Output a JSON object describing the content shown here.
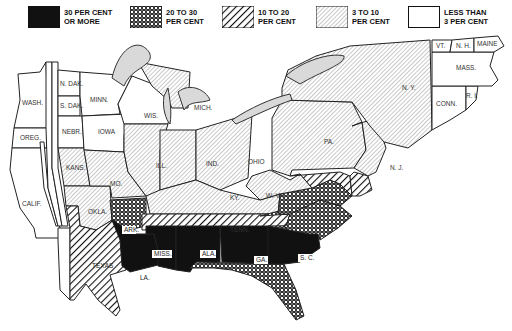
{
  "legend": {
    "items": [
      {
        "key": "c30",
        "label": "30 PER CENT\nOR MORE",
        "pattern": "solid-black"
      },
      {
        "key": "c20",
        "label": "20 TO 30\nPER CENT",
        "pattern": "crosshatch-dots"
      },
      {
        "key": "c10",
        "label": "10 TO 20\nPER CENT",
        "pattern": "wide-diagonal"
      },
      {
        "key": "c3",
        "label": "3 TO 10\nPER CENT",
        "pattern": "fine-diagonal"
      },
      {
        "key": "c0",
        "label": "LESS THAN\n3 PER CENT",
        "pattern": "white"
      }
    ]
  },
  "colors": {
    "ink": "#111111",
    "paper": "#ffffff",
    "lake": "#d9d9d9"
  },
  "map": {
    "states": [
      {
        "label": "WASH.",
        "category": "c0"
      },
      {
        "label": "OREG.",
        "category": "c0"
      },
      {
        "label": "CALIF.",
        "category": "c0"
      },
      {
        "label": "NEV.",
        "category": "c0"
      },
      {
        "label": "IDAHO",
        "category": "c0"
      },
      {
        "label": "UTAH",
        "category": "c0"
      },
      {
        "label": "MONT.",
        "category": "c0"
      },
      {
        "label": "WYO.",
        "category": "c0"
      },
      {
        "label": "COLO.",
        "category": "c0"
      },
      {
        "label": "ARIZ.",
        "category": "c0"
      },
      {
        "label": "N. MEX.",
        "category": "c0"
      },
      {
        "label": "N. DAK.",
        "category": "c0"
      },
      {
        "label": "S. DAK.",
        "category": "c0"
      },
      {
        "label": "NEBR.",
        "category": "c0"
      },
      {
        "label": "KANS.",
        "category": "c3"
      },
      {
        "label": "OKLA.",
        "category": "c3"
      },
      {
        "label": "TEXAS",
        "category": "c10"
      },
      {
        "label": "MINN.",
        "category": "c0"
      },
      {
        "label": "IOWA",
        "category": "c0"
      },
      {
        "label": "MO.",
        "category": "c3"
      },
      {
        "label": "ARK.",
        "category": "c20"
      },
      {
        "label": "LA.",
        "category": "c30"
      },
      {
        "label": "WIS.",
        "category": "c0"
      },
      {
        "label": "ILL.",
        "category": "c3"
      },
      {
        "label": "MICH.",
        "category": "c3"
      },
      {
        "label": "IND.",
        "category": "c3"
      },
      {
        "label": "OHIO",
        "category": "c3"
      },
      {
        "label": "KY.",
        "category": "c3"
      },
      {
        "label": "TENN.",
        "category": "c10"
      },
      {
        "label": "MISS.",
        "category": "c30"
      },
      {
        "label": "ALA.",
        "category": "c30"
      },
      {
        "label": "GA.",
        "category": "c30"
      },
      {
        "label": "FLA.",
        "category": "c20"
      },
      {
        "label": "S. C.",
        "category": "c30"
      },
      {
        "label": "N. C.",
        "category": "c20"
      },
      {
        "label": "VA.",
        "category": "c20"
      },
      {
        "label": "W. VA.",
        "category": "c3"
      },
      {
        "label": "MD.",
        "category": "c10"
      },
      {
        "label": "D. C.",
        "category": "c10"
      },
      {
        "label": "DEL.",
        "category": "c10"
      },
      {
        "label": "PA.",
        "category": "c3"
      },
      {
        "label": "N. J.",
        "category": "c3"
      },
      {
        "label": "N. Y.",
        "category": "c3"
      },
      {
        "label": "CONN.",
        "category": "c0"
      },
      {
        "label": "R. I.",
        "category": "c0"
      },
      {
        "label": "MASS.",
        "category": "c0"
      },
      {
        "label": "VT.",
        "category": "c0"
      },
      {
        "label": "N. H.",
        "category": "c0"
      },
      {
        "label": "MAINE",
        "category": "c0"
      }
    ]
  }
}
